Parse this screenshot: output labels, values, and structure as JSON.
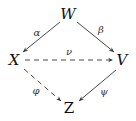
{
  "diagram": {
    "type": "commutative-diagram",
    "nodes": {
      "W": {
        "label": "W",
        "x": 68,
        "y": 19
      },
      "X": {
        "label": "X",
        "x": 14,
        "y": 65
      },
      "V": {
        "label": "V",
        "x": 121,
        "y": 65
      },
      "Z": {
        "label": "Z",
        "x": 69,
        "y": 112
      }
    },
    "edges": [
      {
        "id": "alpha",
        "from": "W",
        "to": "X",
        "label": "α",
        "style": "solid"
      },
      {
        "id": "beta",
        "from": "W",
        "to": "V",
        "label": "β",
        "style": "solid"
      },
      {
        "id": "nu",
        "from": "X",
        "to": "V",
        "label": "ν",
        "style": "dashed"
      },
      {
        "id": "phi",
        "from": "X",
        "to": "Z",
        "label": "φ",
        "style": "dashed"
      },
      {
        "id": "psi",
        "from": "V",
        "to": "Z",
        "label": "ψ",
        "style": "solid"
      }
    ]
  }
}
